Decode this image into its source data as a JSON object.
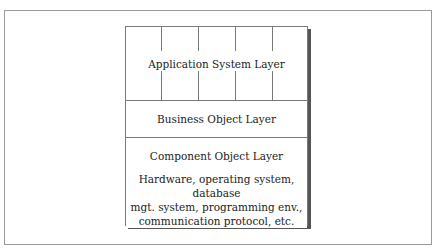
{
  "diagram": {
    "type": "layered-architecture",
    "layers": [
      {
        "id": "application",
        "label": "Application System Layer",
        "columns": 5
      },
      {
        "id": "business",
        "label": "Business Object Layer"
      },
      {
        "id": "component",
        "label": "Component Object Layer"
      },
      {
        "id": "infrastructure",
        "label_lines": [
          "Hardware, operating system, database",
          "mgt. system, programming env.,",
          "communication protocol, etc."
        ]
      }
    ]
  }
}
